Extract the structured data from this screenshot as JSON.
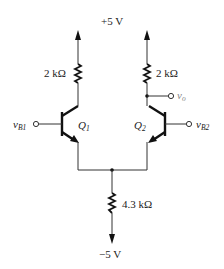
{
  "diagram": {
    "type": "circuit-schematic",
    "supply_positive": {
      "label": "+5 V"
    },
    "supply_negative": {
      "label": "−5 V"
    },
    "collector_resistors": [
      {
        "id": "RC1",
        "label": "2 kΩ"
      },
      {
        "id": "RC2",
        "label": "2 kΩ"
      }
    ],
    "emitter_resistor": {
      "id": "RE",
      "label": "4.3 kΩ"
    },
    "transistors": [
      {
        "id": "Q1",
        "name": "Q",
        "sub": "1"
      },
      {
        "id": "Q2",
        "name": "Q",
        "sub": "2"
      }
    ],
    "inputs": [
      {
        "id": "vB1",
        "name": "v",
        "sub": "B1"
      },
      {
        "id": "vB2",
        "name": "v",
        "sub": "B2"
      }
    ],
    "output": {
      "id": "vo",
      "name": "v",
      "sub": "o"
    },
    "colors": {
      "wire": "#333333",
      "output_label": "#888888"
    }
  }
}
